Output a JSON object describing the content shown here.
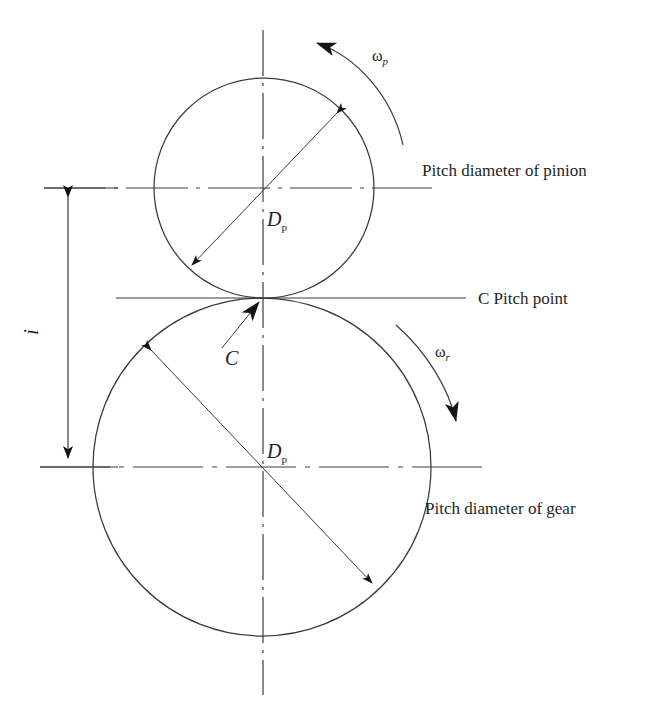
{
  "figure": {
    "background_color": "#ffffff",
    "line_color": "#3a3a3a",
    "text_color": "#1f1f1f"
  },
  "labels": {
    "pitch_diameter_pinion": "Pitch diameter of pinion",
    "pitch_point": "C Pitch point",
    "pitch_diameter_gear": "Pitch diameter of gear",
    "pinion_diameter_symbol": "D",
    "pinion_diameter_subscript": "p",
    "gear_diameter_symbol": "D",
    "gear_diameter_subscript": "p",
    "pitch_point_marker": "C",
    "center_distance_symbol": "i",
    "omega_pinion": "ω",
    "omega_pinion_subscript": "p",
    "omega_gear": "ω",
    "omega_gear_subscript": "r"
  },
  "geometry": {
    "pinion": {
      "center_x": 264,
      "center_y": 188,
      "radius": 110,
      "rotation": "counterclockwise"
    },
    "gear": {
      "center_x": 262,
      "center_y": 467,
      "radius": 169,
      "rotation": "clockwise"
    },
    "pitch_point": {
      "x": 262,
      "y": 298
    },
    "center_distance_line": {
      "x": 68,
      "y_top": 188,
      "y_bottom": 467
    }
  },
  "icons": {
    "arrowhead": "arrowhead-icon",
    "double_arrow": "double-arrow-icon",
    "curved_arrow": "curved-arrow-icon"
  }
}
